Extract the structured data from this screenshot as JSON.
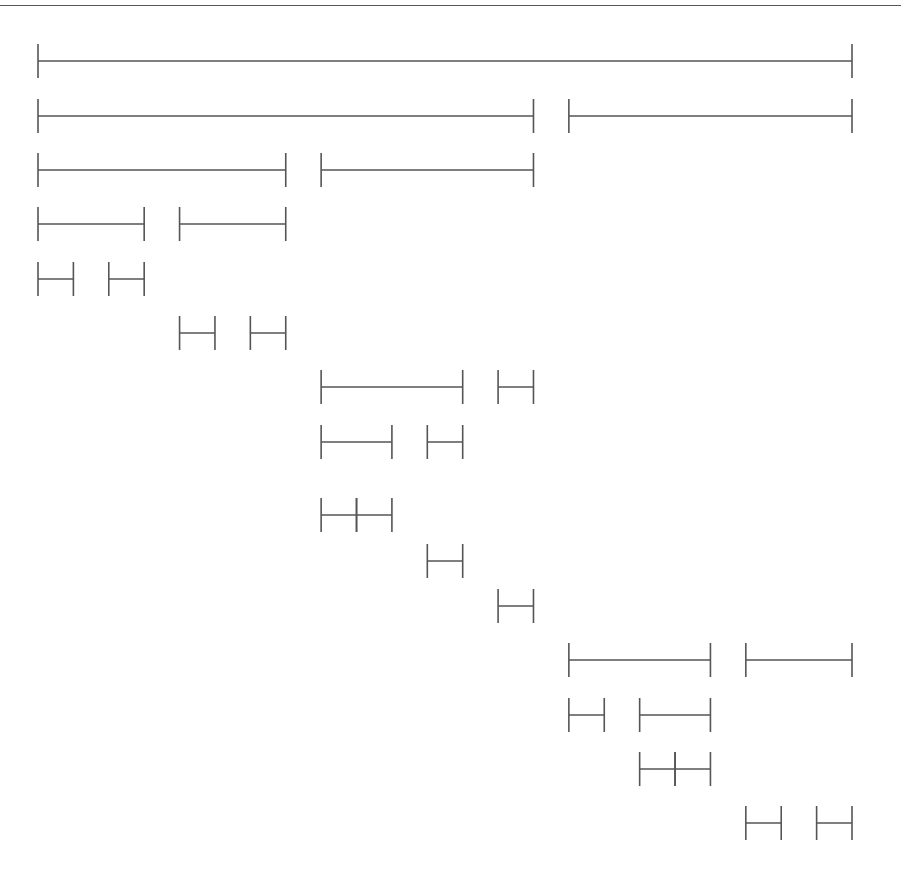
{
  "diagram": {
    "type": "recursive-interval-partition",
    "grid_points": 24,
    "line_color": "#555555",
    "levels": [
      {
        "row": 1,
        "segments": [
          [
            0,
            23
          ]
        ]
      },
      {
        "row": 2,
        "segments": [
          [
            0,
            14
          ],
          [
            15,
            23
          ]
        ]
      },
      {
        "row": 3,
        "segments": [
          [
            0,
            7
          ],
          [
            8,
            14
          ]
        ]
      },
      {
        "row": 4,
        "segments": [
          [
            0,
            3
          ],
          [
            4,
            7
          ]
        ]
      },
      {
        "row": 5,
        "segments": [
          [
            0,
            1
          ],
          [
            2,
            3
          ]
        ]
      },
      {
        "row": 6,
        "segments": [
          [
            4,
            5
          ],
          [
            6,
            7
          ]
        ]
      },
      {
        "row": 7,
        "segments": [
          [
            8,
            12
          ],
          [
            13,
            14
          ]
        ]
      },
      {
        "row": 8,
        "segments": [
          [
            8,
            10
          ],
          [
            11,
            12
          ]
        ]
      },
      {
        "row": 9,
        "segments": [
          [
            8,
            9
          ],
          [
            9,
            10
          ]
        ]
      },
      {
        "row": 10,
        "segments": [
          [
            11,
            12
          ]
        ]
      },
      {
        "row": 11,
        "segments": [
          [
            13,
            14
          ]
        ]
      },
      {
        "row": 12,
        "segments": [
          [
            15,
            19
          ],
          [
            20,
            23
          ]
        ]
      },
      {
        "row": 13,
        "segments": [
          [
            15,
            16
          ],
          [
            17,
            19
          ]
        ]
      },
      {
        "row": 14,
        "segments": [
          [
            17,
            18
          ],
          [
            18,
            19
          ]
        ]
      },
      {
        "row": 15,
        "segments": [
          [
            20,
            21
          ],
          [
            22,
            23
          ]
        ]
      }
    ]
  }
}
